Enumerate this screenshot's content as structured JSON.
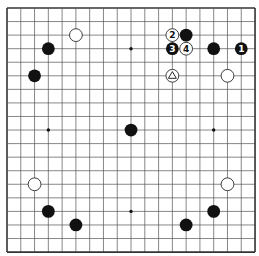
{
  "board": {
    "size": 19,
    "origin_x": 7,
    "origin_y": 8,
    "step_x": 13.78,
    "step_y": 13.56,
    "line_color": "#555555",
    "border_color": "#333333",
    "background": "#ffffff"
  },
  "star_points": [
    [
      3,
      3
    ],
    [
      9,
      3
    ],
    [
      15,
      3
    ],
    [
      3,
      9
    ],
    [
      9,
      9
    ],
    [
      15,
      9
    ],
    [
      3,
      15
    ],
    [
      9,
      15
    ],
    [
      15,
      15
    ]
  ],
  "stones": [
    {
      "col": 5,
      "row": 2,
      "color": "white",
      "label": ""
    },
    {
      "col": 3,
      "row": 3,
      "color": "black",
      "label": ""
    },
    {
      "col": 2,
      "row": 5,
      "color": "black",
      "label": ""
    },
    {
      "col": 12,
      "row": 2,
      "color": "white",
      "label": "2"
    },
    {
      "col": 13,
      "row": 2,
      "color": "black",
      "label": ""
    },
    {
      "col": 12,
      "row": 3,
      "color": "black",
      "label": "3"
    },
    {
      "col": 13,
      "row": 3,
      "color": "white",
      "label": "4"
    },
    {
      "col": 15,
      "row": 3,
      "color": "black",
      "label": ""
    },
    {
      "col": 17,
      "row": 3,
      "color": "black",
      "label": "1"
    },
    {
      "col": 12,
      "row": 5,
      "color": "white",
      "label": "",
      "marker": "triangle"
    },
    {
      "col": 16,
      "row": 5,
      "color": "white",
      "label": ""
    },
    {
      "col": 9,
      "row": 9,
      "color": "black",
      "label": ""
    },
    {
      "col": 2,
      "row": 13,
      "color": "white",
      "label": ""
    },
    {
      "col": 16,
      "row": 13,
      "color": "white",
      "label": ""
    },
    {
      "col": 3,
      "row": 15,
      "color": "black",
      "label": ""
    },
    {
      "col": 15,
      "row": 15,
      "color": "black",
      "label": ""
    },
    {
      "col": 5,
      "row": 16,
      "color": "black",
      "label": ""
    },
    {
      "col": 13,
      "row": 16,
      "color": "black",
      "label": ""
    }
  ]
}
